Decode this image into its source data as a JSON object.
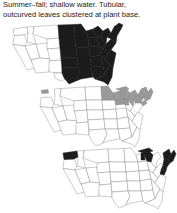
{
  "caption": {
    "line1": "Summer–fall; shallow water. Tubular,",
    "line2": "outcurved leaves clustered at plant base.",
    "full": "Summer–fall; shallow water. Tubular,\noutcurved leaves clustered at plant base."
  },
  "colors": {
    "background": "#ffffff",
    "text": "#1a1a1a",
    "state_outline": "#8d8d8d",
    "range_dark": "#1c1c1c",
    "range_gray": "#9a9a9a",
    "unshaded": "#ffffff"
  },
  "maps": [
    {
      "id": "map-1",
      "label": "distribution-map-1",
      "shading": "dark",
      "shaded_regions": [
        "North Dakota",
        "South Dakota",
        "Nebraska",
        "Kansas",
        "Oklahoma",
        "Texas (east)",
        "Minnesota",
        "Iowa",
        "Missouri",
        "Arkansas",
        "Louisiana",
        "Wisconsin",
        "Illinois",
        "Michigan",
        "Indiana",
        "Ohio",
        "Kentucky",
        "Tennessee",
        "Mississippi",
        "Alabama",
        "Georgia",
        "Florida",
        "South Carolina",
        "North Carolina",
        "Virginia",
        "West Virginia",
        "Pennsylvania",
        "New York",
        "Maryland",
        "Delaware",
        "New Jersey",
        "Connecticut",
        "Rhode Island",
        "Massachusetts",
        "Vermont",
        "New Hampshire",
        "Maine"
      ],
      "unshaded_regions": [
        "Washington",
        "Oregon",
        "California",
        "Idaho",
        "Nevada",
        "Utah",
        "Arizona",
        "Montana",
        "Wyoming",
        "Colorado",
        "New Mexico",
        "Texas (west)"
      ]
    },
    {
      "id": "map-2",
      "label": "distribution-map-2",
      "shading": "gray",
      "shaded_regions": [
        "Minnesota",
        "Wisconsin",
        "Michigan",
        "Illinois (north)",
        "Indiana (north)",
        "Ohio",
        "Pennsylvania",
        "New York",
        "Vermont",
        "New Hampshire",
        "Maine",
        "Massachusetts",
        "Connecticut",
        "Rhode Island",
        "New Jersey",
        "Washington (tip)"
      ],
      "unshaded_regions": [
        "Oregon",
        "California",
        "Idaho",
        "Nevada",
        "Utah",
        "Arizona",
        "Montana",
        "Wyoming",
        "Colorado",
        "New Mexico",
        "Texas",
        "North Dakota",
        "South Dakota",
        "Nebraska",
        "Kansas",
        "Oklahoma",
        "Iowa",
        "Missouri",
        "Arkansas",
        "Louisiana",
        "Kentucky",
        "Tennessee",
        "Mississippi",
        "Alabama",
        "Georgia",
        "Florida",
        "South Carolina",
        "North Carolina",
        "Virginia",
        "West Virginia",
        "Maryland",
        "Delaware"
      ]
    },
    {
      "id": "map-3",
      "label": "distribution-map-3",
      "shading": "dark",
      "shaded_regions": [
        "Washington",
        "Michigan",
        "Wisconsin (east)",
        "New York (east)",
        "Vermont",
        "New Hampshire",
        "Maine",
        "Massachusetts",
        "Connecticut",
        "Rhode Island",
        "New Jersey",
        "Pennsylvania (east)",
        "Maryland",
        "Delaware",
        "Virginia (east)"
      ],
      "unshaded_regions": [
        "Oregon",
        "California",
        "Idaho",
        "Nevada",
        "Utah",
        "Arizona",
        "Montana",
        "Wyoming",
        "Colorado",
        "New Mexico",
        "Texas",
        "North Dakota",
        "South Dakota",
        "Nebraska",
        "Kansas",
        "Oklahoma",
        "Minnesota",
        "Iowa",
        "Missouri",
        "Arkansas",
        "Louisiana",
        "Illinois",
        "Indiana",
        "Ohio",
        "Kentucky",
        "Tennessee",
        "Mississippi",
        "Alabama",
        "Georgia",
        "Florida",
        "South Carolina",
        "North Carolina",
        "West Virginia"
      ]
    }
  ]
}
